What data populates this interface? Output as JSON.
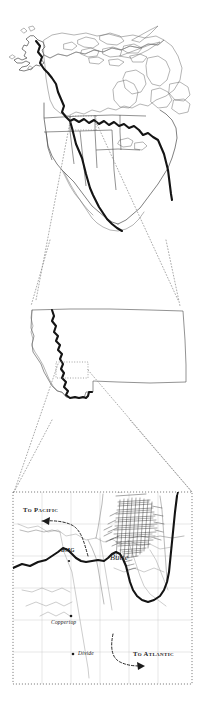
{
  "figure": {
    "panels": [
      {
        "id": "north-america",
        "name": "North America overview map"
      },
      {
        "id": "montana",
        "name": "State of Montana outline"
      },
      {
        "id": "butte-detail",
        "name": "Butte vicinity detail map"
      }
    ]
  },
  "overview_map": {
    "name": "north-america-overview",
    "feature": "Continental Divide traced from Alaska through Mexico",
    "inset_box_label": ""
  },
  "state_map": {
    "name": "montana-outline",
    "feature": "Continental Divide crossing western Montana",
    "inset_box_label": ""
  },
  "detail_map": {
    "name": "butte-vicinity",
    "labels": {
      "to_pacific": "To Pacific",
      "to_atlantic": "To Atlantic",
      "butte": "Butte",
      "bmo": "BMG",
      "coppertop": "Coppertop",
      "divide": "Divide"
    },
    "arrows": [
      {
        "name": "pacific-flow-arrow",
        "direction": "west",
        "label": "To Pacific"
      },
      {
        "name": "atlantic-flow-arrow",
        "direction": "east",
        "label": "To Atlantic"
      }
    ]
  },
  "colors": {
    "divide_line": "#141414",
    "coastline": "#3c3c3c",
    "state_line": "#4a4a4a",
    "leader_line": "#8d8d8d",
    "grid": "#c9c9c9",
    "river": "#9a9a9a",
    "urban": "#262626",
    "background": "#ffffff"
  }
}
